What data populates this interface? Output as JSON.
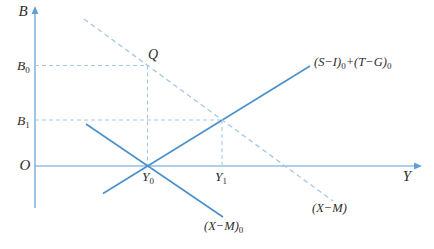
{
  "figure": {
    "width": 434,
    "height": 249,
    "background": "#ffffff"
  },
  "style": {
    "axis_color": "#5f9ed6",
    "solid_line_color": "#4a90c9",
    "dashed_line_color": "#a5c8e6",
    "guide_color": "#a5c8e6",
    "text_color": "#2e2e2e"
  },
  "axes": {
    "y_axis": {
      "label": "B",
      "x": 35,
      "top": 13,
      "bottom": 208,
      "label_x": 23,
      "label_y": 16
    },
    "x_axis": {
      "label": "Y",
      "y": 166,
      "left": 35,
      "right": 415,
      "label_x": 407,
      "label_y": 181
    },
    "origin": {
      "label": "O",
      "x": 25,
      "y": 170
    }
  },
  "curves": [
    {
      "name": "si-tg-line",
      "style": "solid",
      "x1": 103,
      "y1": 193.5,
      "x2": 310,
      "y2": 66,
      "label": {
        "name": "si-tg-label",
        "text": "(S−I)_0+(T−G)_0",
        "x": 314,
        "y": 66,
        "anchor": "start"
      }
    },
    {
      "name": "xm0-line",
      "style": "solid",
      "x1": 86,
      "y1": 124,
      "x2": 223,
      "y2": 217,
      "label": {
        "name": "xm0-label",
        "text": "(X−M)_0",
        "x": 204,
        "y": 230,
        "anchor": "start"
      }
    },
    {
      "name": "xm-dashed-line",
      "style": "dashed",
      "x1": 84,
      "y1": 19,
      "x2": 333,
      "y2": 201,
      "label": {
        "name": "xm-label",
        "text": "(X−M)",
        "x": 312,
        "y": 212,
        "anchor": "start"
      }
    }
  ],
  "guides": [
    {
      "name": "b0-guide-horizontal",
      "x1": 35,
      "y1": 65.5,
      "x2": 147.5,
      "y2": 65.5
    },
    {
      "name": "y0-guide-vertical",
      "x1": 147.5,
      "y1": 65.5,
      "x2": 147.5,
      "y2": 166
    },
    {
      "name": "b1-guide-horizontal",
      "x1": 35,
      "y1": 120,
      "x2": 222,
      "y2": 120
    },
    {
      "name": "y1-guide-vertical",
      "x1": 222,
      "y1": 120,
      "x2": 222,
      "y2": 166
    }
  ],
  "point_labels": [
    {
      "name": "label-b0",
      "text": "B_0",
      "x": 17,
      "y": 70,
      "anchor": "start",
      "cls": "point-label"
    },
    {
      "name": "label-b1",
      "text": "B_1",
      "x": 17,
      "y": 125,
      "anchor": "start",
      "cls": "point-label"
    },
    {
      "name": "label-y0",
      "text": "Y_0",
      "x": 142,
      "y": 181,
      "anchor": "start",
      "cls": "point-label"
    },
    {
      "name": "label-y1",
      "text": "Y_1",
      "x": 215,
      "y": 181,
      "anchor": "start",
      "cls": "point-label"
    },
    {
      "name": "label-q",
      "text": "Q",
      "x": 148,
      "y": 59,
      "anchor": "start",
      "cls": "q-label"
    }
  ]
}
